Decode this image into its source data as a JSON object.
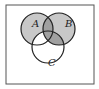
{
  "diagram": {
    "type": "venn",
    "sets": [
      {
        "name": "A",
        "label": "A",
        "cx": 37,
        "cy": 29,
        "r": 16
      },
      {
        "name": "B",
        "label": "B",
        "cx": 59,
        "cy": 29,
        "r": 16
      },
      {
        "name": "C",
        "label": "C",
        "cx": 48,
        "cy": 47,
        "r": 16
      }
    ],
    "shaded_regions": [
      "A",
      "B",
      "A∩B",
      "B∩C"
    ],
    "colors": {
      "frame": "#555555",
      "outline": "#222222",
      "light_shade": "#c8c8c8",
      "dark_shade": "#a0a0a0",
      "background": "#ffffff"
    }
  }
}
